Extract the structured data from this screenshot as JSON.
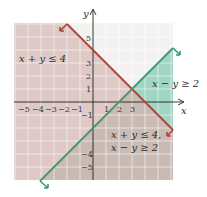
{
  "figure": {
    "title": "",
    "axes": {
      "x_label": "x",
      "y_label": "y",
      "x_ticks": [
        "−5",
        "−4",
        "−3",
        "−2",
        "−1",
        "1",
        "2",
        "3"
      ],
      "y_ticks": [
        "5",
        "3",
        "2",
        "1",
        "−1",
        "−4",
        "−5"
      ],
      "xlim": [
        -6,
        6
      ],
      "ylim": [
        -6,
        6
      ]
    },
    "region_labels": {
      "ineq1": "x + y ≤ 4",
      "ineq2": "x − y ≥ 2",
      "solution_line1": "x + y ≤ 4,",
      "solution_line2": "x − y ≥ 2"
    },
    "lines": [
      {
        "name": "x + y = 4",
        "color": "#a5473f",
        "shade": "below-left",
        "shade_color": "#d9c2bf"
      },
      {
        "name": "x − y = 2",
        "color": "#3a9a72",
        "shade": "below-right",
        "shade_color": "#8fcdbb"
      }
    ],
    "colors": {
      "grid": "#ffffff",
      "grid_bg": "#f1eeee",
      "overlap": "#c7b8b2",
      "axis": "#222222"
    }
  }
}
